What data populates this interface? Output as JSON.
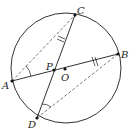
{
  "diagram": {
    "colors": {
      "stroke": "#333333",
      "dashed": "#555555",
      "background": "#ffffff"
    },
    "points": {
      "A": {
        "label": "A"
      },
      "B": {
        "label": "B"
      },
      "C": {
        "label": "C"
      },
      "D": {
        "label": "D"
      },
      "P": {
        "label": "P"
      },
      "O": {
        "label": "O"
      }
    },
    "segments": [
      {
        "name": "chord-ab",
        "from": "A",
        "to": "B",
        "style": "solid"
      },
      {
        "name": "chord-cd",
        "from": "C",
        "to": "D",
        "style": "solid"
      },
      {
        "name": "segment-ac",
        "from": "A",
        "to": "C",
        "style": "dashed"
      },
      {
        "name": "segment-db",
        "from": "D",
        "to": "B",
        "style": "dashed"
      }
    ],
    "markers": [
      {
        "name": "angle-mark-a",
        "at": "A",
        "type": "angle-arc"
      },
      {
        "name": "angle-mark-d",
        "at": "D",
        "type": "angle-arc"
      },
      {
        "name": "tick-mark-pc",
        "on": "PC",
        "type": "double-tick"
      },
      {
        "name": "tick-mark-pb",
        "on": "PB",
        "type": "double-tick"
      }
    ]
  }
}
